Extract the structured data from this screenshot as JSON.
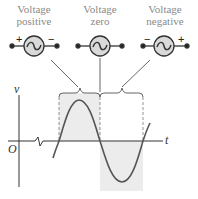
{
  "sources": [
    {
      "id": "positive",
      "label_line1": "Voltage",
      "label_line2": "positive",
      "left_sign": "+",
      "right_sign": "−",
      "symbol": "ac-source-icon"
    },
    {
      "id": "zero",
      "label_line1": "Voltage",
      "label_line2": "zero",
      "left_sign": "",
      "right_sign": "",
      "symbol": "ac-source-icon"
    },
    {
      "id": "negative",
      "label_line1": "Voltage",
      "label_line2": "negative",
      "left_sign": "−",
      "right_sign": "+",
      "symbol": "ac-source-icon"
    }
  ],
  "axes": {
    "y_label": "v",
    "x_label": "t",
    "origin_label": "O"
  },
  "colors": {
    "line": "#444444",
    "circle_fill": "#d9d9d9",
    "shade": "#ececec",
    "label_text": "#8a8a8a"
  },
  "waveform": {
    "type": "sine",
    "zero_crossings_px": [
      59,
      100,
      143
    ],
    "positive_half": "shaded region 59-100",
    "negative_half": "shaded region 100-143"
  }
}
